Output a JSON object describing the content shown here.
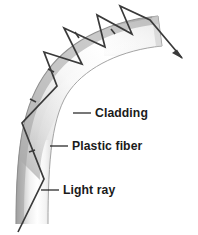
{
  "figure": {
    "background_color": "#ffffff"
  },
  "fiber": {
    "name": "plastic-fiber-tube",
    "description": "Curved translucent fiber tube bending from vertical at bottom-left to horizontal at top-right",
    "outer_edge_color": "#8c8c8c",
    "core_highlight_color": "#ffffff",
    "shadow_color": "#9a9a9a",
    "cladding_color": "#d7d7d7"
  },
  "light_ray": {
    "name": "light-ray-path",
    "stroke_color": "#3a3a3a",
    "stroke_width": 1.6,
    "arrowhead": "exit-arrow",
    "bounce_count": 7,
    "direction_ticks": 5
  },
  "labels": [
    {
      "id": "cladding",
      "text": "Cladding",
      "x": 95,
      "y": 117,
      "leader_x1": 73,
      "leader_y1": 113,
      "leader_x2": 91,
      "leader_y2": 113
    },
    {
      "id": "plastic-fiber",
      "text": "Plastic fiber",
      "x": 72,
      "y": 150,
      "leader_x1": 50,
      "leader_y1": 146,
      "leader_x2": 68,
      "leader_y2": 146
    },
    {
      "id": "light-ray",
      "text": "Light ray",
      "x": 63,
      "y": 194,
      "leader_x1": 41,
      "leader_y1": 190,
      "leader_x2": 59,
      "leader_y2": 190
    }
  ]
}
